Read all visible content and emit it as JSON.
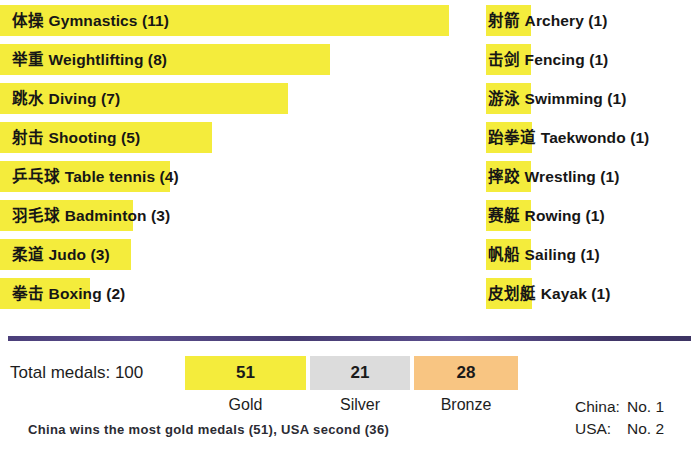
{
  "chart_data": {
    "type": "bar",
    "xlabel": "",
    "ylabel": "",
    "orientation": "horizontal",
    "categories": [
      "体操 Gymnastics",
      "举重 Weightlifting",
      "跳水 Diving",
      "射击 Shooting",
      "乒乓球 Table tennis",
      "羽毛球 Badminton",
      "柔道 Judo",
      "拳击 Boxing",
      "射箭 Archery",
      "击剑 Fencing",
      "游泳 Swimming",
      "跆拳道 Taekwondo",
      "摔跤 Wrestling",
      "赛艇 Rowing",
      "帆船 Sailing",
      "皮划艇 Kayak"
    ],
    "values": [
      11,
      8,
      7,
      5,
      4,
      3,
      3,
      2,
      1,
      1,
      1,
      1,
      1,
      1,
      1,
      1
    ],
    "grid": false,
    "legend": "none",
    "bar_color": "#f4ec3c",
    "totals": {
      "gold": 51,
      "silver": 21,
      "bronze": 28,
      "total": 100
    }
  },
  "left_column": {
    "rows": [
      {
        "cn": "体操",
        "en": "Gymnastics",
        "count": 11,
        "label": "体操 Gymnastics (11)",
        "bar_width": 449
      },
      {
        "cn": "举重",
        "en": "Weightlifting",
        "count": 8,
        "label": "举重 Weightlifting (8)",
        "bar_width": 330
      },
      {
        "cn": "跳水",
        "en": "Diving",
        "count": 7,
        "label": "跳水 Diving (7)",
        "bar_width": 288
      },
      {
        "cn": "射击",
        "en": "Shooting",
        "count": 5,
        "label": "射击 Shooting (5)",
        "bar_width": 212
      },
      {
        "cn": "乒乓球",
        "en": "Table tennis",
        "count": 4,
        "label": "乒乓球 Table tennis (4)",
        "bar_width": 170
      },
      {
        "cn": "羽毛球",
        "en": "Badminton",
        "count": 3,
        "label": "羽毛球 Badminton (3)",
        "bar_width": 133
      },
      {
        "cn": "柔道",
        "en": "Judo",
        "count": 3,
        "label": "柔道 Judo (3)",
        "bar_width": 131
      },
      {
        "cn": "拳击",
        "en": "Boxing",
        "count": 2,
        "label": "拳击 Boxing (2)",
        "bar_width": 90
      }
    ]
  },
  "right_column": {
    "rows": [
      {
        "cn": "射箭",
        "en": "Archery",
        "count": 1,
        "label": "射箭 Archery (1)",
        "bar_width": 45
      },
      {
        "cn": "击剑",
        "en": "Fencing",
        "count": 1,
        "label": "击剑 Fencing (1)",
        "bar_width": 45
      },
      {
        "cn": "游泳",
        "en": "Swimming",
        "count": 1,
        "label": "游泳 Swimming (1)",
        "bar_width": 45
      },
      {
        "cn": "跆拳道",
        "en": "Taekwondo",
        "count": 1,
        "label": "跆拳道 Taekwondo (1)",
        "bar_width": 46
      },
      {
        "cn": "摔跤",
        "en": "Wrestling",
        "count": 1,
        "label": "摔跤 Wrestling (1)",
        "bar_width": 45
      },
      {
        "cn": "赛艇",
        "en": "Rowing",
        "count": 1,
        "label": "赛艇 Rowing (1)",
        "bar_width": 45
      },
      {
        "cn": "帆船",
        "en": "Sailing",
        "count": 1,
        "label": "帆船 Sailing (1)",
        "bar_width": 45
      },
      {
        "cn": "皮划艇",
        "en": "Kayak",
        "count": 1,
        "label": "皮划艇 Kayak (1)",
        "bar_width": 46
      }
    ]
  },
  "totals": {
    "label": "Total medals: 100",
    "gold": {
      "value": "51",
      "caption": "Gold",
      "color": "#f4ec3c"
    },
    "silver": {
      "value": "21",
      "caption": "Silver",
      "color": "#dcdcdc"
    },
    "bronze": {
      "value": "28",
      "caption": "Bronze",
      "color": "#f8c582"
    }
  },
  "ranking": {
    "rows": [
      {
        "country": "China:",
        "place": "No. 1"
      },
      {
        "country": "USA:",
        "place": "No. 2"
      }
    ]
  },
  "caption": "China wins the most gold medals (51), USA second (36)",
  "colors": {
    "highlight": "#f4ec3c",
    "silver": "#dcdcdc",
    "bronze": "#f8c582",
    "divider": "#4b3f7a",
    "text": "#1a1a1a",
    "background": "#ffffff"
  }
}
